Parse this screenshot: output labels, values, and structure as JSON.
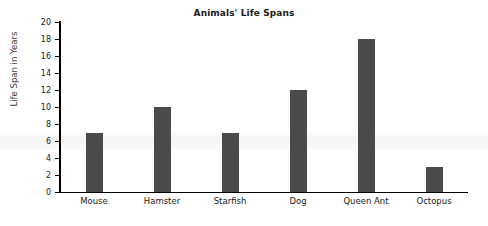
{
  "chart_data": {
    "type": "bar",
    "title": "Animals' Life Spans",
    "xlabel": "",
    "ylabel": "Life Span in Years",
    "categories": [
      "Mouse",
      "Hamster",
      "Starfish",
      "Dog",
      "Queen Ant",
      "Octopus"
    ],
    "values": [
      7,
      10,
      7,
      12,
      18,
      3
    ],
    "ylim": [
      0,
      20
    ],
    "ytick_labels": [
      "20",
      "18",
      "16",
      "14",
      "12",
      "10",
      "8",
      "6",
      "4",
      "2",
      "0"
    ],
    "ytick_values": [
      20,
      18,
      16,
      14,
      12,
      10,
      8,
      6,
      4,
      2,
      0
    ],
    "grid": false,
    "legend": false,
    "bar_color": "#4a4a4a",
    "axis_color": "#000000",
    "background_color": "#ffffff",
    "title_color": "#1a1a1a",
    "label_color": "#3c3c3c"
  }
}
